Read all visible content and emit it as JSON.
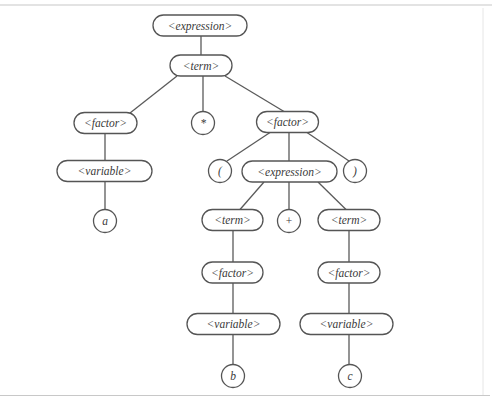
{
  "diagram": {
    "type": "parse-tree",
    "colors": {
      "stroke": "#555555",
      "text": "#3a3a3a",
      "frame": "#c8c8c8",
      "background": "#ffffff"
    },
    "nodes": [
      {
        "id": "expression_root",
        "label": "<expression>",
        "shape": "pill",
        "cx": 200,
        "cy": 25.5,
        "w": 94,
        "h": 21
      },
      {
        "id": "term_root",
        "label": "<term>",
        "shape": "pill",
        "cx": 201,
        "cy": 65.5,
        "w": 62,
        "h": 21
      },
      {
        "id": "factor_left",
        "label": "<factor>",
        "shape": "pill",
        "cx": 105.5,
        "cy": 123,
        "w": 63,
        "h": 21
      },
      {
        "id": "times",
        "label": "*",
        "shape": "circle",
        "cx": 203,
        "cy": 123,
        "r": 11.5
      },
      {
        "id": "factor_right",
        "label": "<factor>",
        "shape": "pill",
        "cx": 287.5,
        "cy": 122,
        "w": 62,
        "h": 21
      },
      {
        "id": "variable_a",
        "label": "<variable>",
        "shape": "pill",
        "cx": 104.5,
        "cy": 171,
        "w": 95,
        "h": 21
      },
      {
        "id": "a",
        "label": "a",
        "shape": "circle",
        "cx": 105,
        "cy": 221,
        "r": 11.5
      },
      {
        "id": "lparen",
        "label": "(",
        "shape": "circle",
        "cx": 220,
        "cy": 171,
        "r": 11.5
      },
      {
        "id": "expression_inner",
        "label": "<expression>",
        "shape": "pill",
        "cx": 289.5,
        "cy": 171.5,
        "w": 95,
        "h": 21
      },
      {
        "id": "rparen",
        "label": ")",
        "shape": "circle",
        "cx": 355,
        "cy": 171,
        "r": 11.5
      },
      {
        "id": "term_b",
        "label": "<term>",
        "shape": "pill",
        "cx": 232.5,
        "cy": 220,
        "w": 61,
        "h": 21
      },
      {
        "id": "plus",
        "label": "+",
        "shape": "circle",
        "cx": 289,
        "cy": 221,
        "r": 11.5
      },
      {
        "id": "term_c",
        "label": "<term>",
        "shape": "pill",
        "cx": 349,
        "cy": 220,
        "w": 62,
        "h": 21
      },
      {
        "id": "factor_b",
        "label": "<factor>",
        "shape": "pill",
        "cx": 232.5,
        "cy": 272.5,
        "w": 61,
        "h": 21
      },
      {
        "id": "factor_c",
        "label": "<factor>",
        "shape": "pill",
        "cx": 349,
        "cy": 272.5,
        "w": 62,
        "h": 21
      },
      {
        "id": "variable_b",
        "label": "<variable>",
        "shape": "pill",
        "cx": 233.5,
        "cy": 324,
        "w": 93,
        "h": 21
      },
      {
        "id": "variable_c",
        "label": "<variable>",
        "shape": "pill",
        "cx": 346.5,
        "cy": 324,
        "w": 93,
        "h": 21
      },
      {
        "id": "b",
        "label": "b",
        "shape": "circle",
        "cx": 233,
        "cy": 376,
        "r": 11.5
      },
      {
        "id": "c",
        "label": "c",
        "shape": "circle",
        "cx": 350,
        "cy": 376,
        "r": 11.5
      }
    ],
    "edges": [
      {
        "from": "expression_root",
        "to": "term_root",
        "x1": 201,
        "y1": 36,
        "x2": 201,
        "y2": 55
      },
      {
        "from": "term_root",
        "to": "factor_left",
        "x1": 177,
        "y1": 76,
        "x2": 130,
        "y2": 113
      },
      {
        "from": "term_root",
        "to": "times",
        "x1": 203,
        "y1": 76,
        "x2": 203,
        "y2": 111.5
      },
      {
        "from": "term_root",
        "to": "factor_right",
        "x1": 225,
        "y1": 76,
        "x2": 284,
        "y2": 111.5
      },
      {
        "from": "factor_left",
        "to": "variable_a",
        "x1": 105,
        "y1": 133.5,
        "x2": 105,
        "y2": 160.5
      },
      {
        "from": "variable_a",
        "to": "a",
        "x1": 105,
        "y1": 181.5,
        "x2": 105,
        "y2": 209.5
      },
      {
        "from": "factor_right",
        "to": "lparen",
        "x1": 270,
        "y1": 132.5,
        "x2": 227,
        "y2": 161
      },
      {
        "from": "factor_right",
        "to": "expression_inner",
        "x1": 289,
        "y1": 132.5,
        "x2": 289,
        "y2": 161
      },
      {
        "from": "factor_right",
        "to": "rparen",
        "x1": 307,
        "y1": 132.5,
        "x2": 349,
        "y2": 161
      },
      {
        "from": "expression_inner",
        "to": "term_b",
        "x1": 264,
        "y1": 182,
        "x2": 240,
        "y2": 209.5
      },
      {
        "from": "expression_inner",
        "to": "plus",
        "x1": 289,
        "y1": 182,
        "x2": 289,
        "y2": 209.5
      },
      {
        "from": "expression_inner",
        "to": "term_c",
        "x1": 318,
        "y1": 182,
        "x2": 346,
        "y2": 209.5
      },
      {
        "from": "term_b",
        "to": "factor_b",
        "x1": 233,
        "y1": 230.5,
        "x2": 233,
        "y2": 262
      },
      {
        "from": "term_c",
        "to": "factor_c",
        "x1": 349,
        "y1": 230.5,
        "x2": 349,
        "y2": 262
      },
      {
        "from": "factor_b",
        "to": "variable_b",
        "x1": 233,
        "y1": 283,
        "x2": 233,
        "y2": 313.5
      },
      {
        "from": "factor_c",
        "to": "variable_c",
        "x1": 349,
        "y1": 283,
        "x2": 349,
        "y2": 313.5
      },
      {
        "from": "variable_b",
        "to": "b",
        "x1": 233,
        "y1": 334.5,
        "x2": 233,
        "y2": 364.5
      },
      {
        "from": "variable_c",
        "to": "c",
        "x1": 349,
        "y1": 334.5,
        "x2": 349,
        "y2": 364.5
      }
    ]
  }
}
